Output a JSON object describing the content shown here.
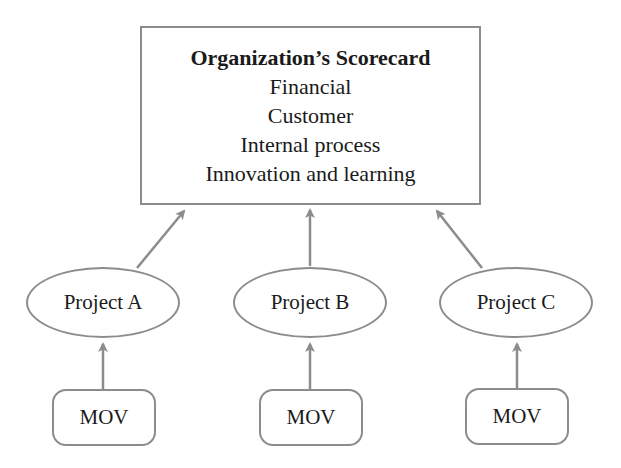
{
  "diagram": {
    "scorecard": {
      "title": "Organization’s Scorecard",
      "items": [
        "Financial",
        "Customer",
        "Internal process",
        "Innovation and learning"
      ]
    },
    "projects": [
      {
        "label": "Project A",
        "mov": "MOV"
      },
      {
        "label": "Project B",
        "mov": "MOV"
      },
      {
        "label": "Project C",
        "mov": "MOV"
      }
    ],
    "colors": {
      "stroke": "#8c8c8c",
      "text": "#1a1a1a",
      "background": "#ffffff"
    }
  }
}
